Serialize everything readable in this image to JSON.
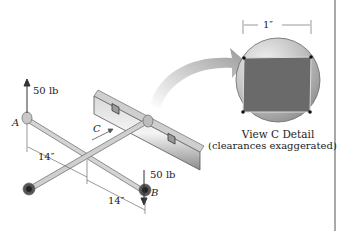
{
  "figure": {
    "force_top_label": "50 lb",
    "force_bottom_label": "50 lb",
    "point_a": "A",
    "point_b": "B",
    "point_c": "C",
    "dim_left": "14″",
    "dim_right": "14″",
    "detail_dim": "1″",
    "detail_title": "View C Detail",
    "detail_subtitle": "(clearances exaggerated)"
  },
  "colors": {
    "steel_light": "#e6e6e6",
    "steel_mid": "#b5b5b5",
    "steel_dark": "#6f6f6f",
    "socket_square": "#6a6a6a",
    "line": "#333333"
  }
}
